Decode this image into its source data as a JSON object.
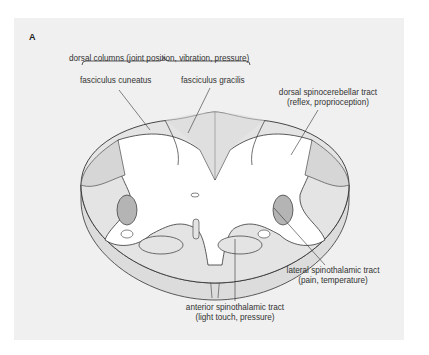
{
  "figure": {
    "panel_label": "A",
    "labels": {
      "dorsal_columns": "dorsal columns (joint position, vibration, pressure)",
      "fasciculus_cuneatus": "fasciculus cuneatus",
      "fasciculus_gracilis": "fasciculus gracilis",
      "dorsal_spinocerebellar_line1": "dorsal spinocerebellar tract",
      "dorsal_spinocerebellar_line2": "(reflex, proprioception)",
      "lateral_spinothalamic_line1": "lateral spinothalamic tract",
      "lateral_spinothalamic_line2": "(pain, temperature)",
      "anterior_spinothalamic_line1": "anterior spinothalamic tract",
      "anterior_spinothalamic_line2": "(light touch, pressure)"
    },
    "colors": {
      "panel_bg": "#f0f0f0",
      "white_matter": "#e4e4e4",
      "grey_matter": "#ffffff",
      "lateral_tract": "#b4b4b4",
      "outline": "#333333"
    }
  }
}
